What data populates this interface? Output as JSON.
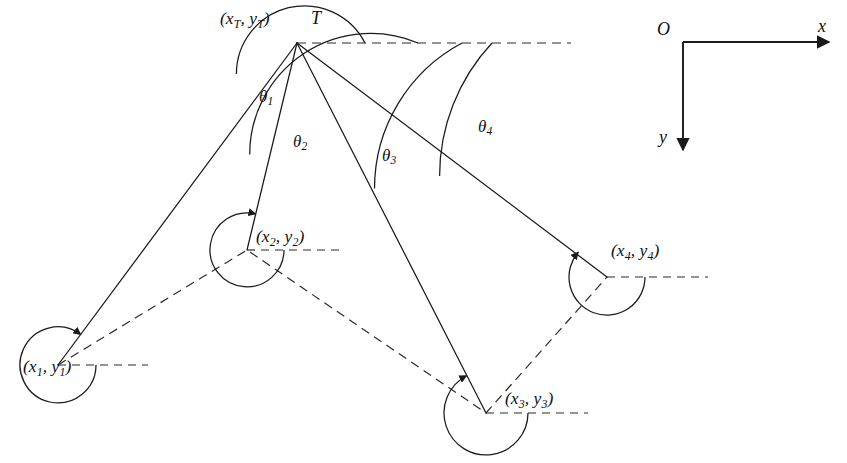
{
  "figure": {
    "type": "geometry-diagram",
    "background_color": "#ffffff",
    "line_color": "#1a1a1a",
    "width": 847,
    "height": 463
  },
  "apex": {
    "name": "T",
    "label": "T",
    "coord_label_open": "(",
    "coord_label_x": "x",
    "coord_label_x_sub": "T",
    "coord_label_comma": ",",
    "coord_label_y": "y",
    "coord_label_y_sub": "T",
    "coord_label_close": ")",
    "x": 297,
    "y": 43
  },
  "reference_line": {
    "name": "horizontal-reference-from-T",
    "style": "dashed",
    "x_start": 297,
    "x_end": 571,
    "y": 43
  },
  "angles": [
    {
      "id": "theta1",
      "symbol": "θ",
      "subscript": "1",
      "arc_radius": 68,
      "label_x": 259,
      "label_y": 88,
      "degrees_from_horizontal": 153
    },
    {
      "id": "theta2",
      "symbol": "θ",
      "subscript": "2",
      "arc_radius": 121,
      "label_x": 293,
      "label_y": 133,
      "degrees_from_horizontal": 113
    },
    {
      "id": "theta3",
      "symbol": "θ",
      "subscript": "3",
      "arc_radius": 165,
      "label_x": 382,
      "label_y": 147,
      "degrees_from_horizontal": 62
    },
    {
      "id": "theta4",
      "symbol": "θ",
      "subscript": "4",
      "arc_radius": 195,
      "label_x": 478,
      "label_y": 118,
      "degrees_from_horizontal": 43
    }
  ],
  "points": [
    {
      "id": "p1",
      "index": "1",
      "open": "(",
      "x_sym": "x",
      "comma": ",",
      "y_sym": "y",
      "close": ")",
      "x": 58,
      "y": 365,
      "label_x": 23,
      "label_y": 358,
      "arc_radius": 38,
      "ref_dash_x_end": 148
    },
    {
      "id": "p2",
      "index": "2",
      "open": "(",
      "x_sym": "x",
      "comma": ",",
      "y_sym": "y",
      "close": ")",
      "x": 247,
      "y": 250,
      "label_x": 256,
      "label_y": 228,
      "arc_radius": 37,
      "ref_dash_x_end": 345
    },
    {
      "id": "p3",
      "index": "3",
      "open": "(",
      "x_sym": "x",
      "comma": ",",
      "y_sym": "y",
      "close": ")",
      "x": 486,
      "y": 413,
      "label_x": 505,
      "label_y": 390,
      "arc_radius": 42,
      "ref_dash_x_end": 588
    },
    {
      "id": "p4",
      "index": "4",
      "open": "(",
      "x_sym": "x",
      "comma": ",",
      "y_sym": "y",
      "close": ")",
      "x": 607,
      "y": 277,
      "label_x": 611,
      "label_y": 242,
      "arc_radius": 38,
      "ref_dash_x_end": 708
    }
  ],
  "trajectory": {
    "name": "dashed-waypoint-path",
    "style": "dashed",
    "vertices": [
      [
        58,
        365
      ],
      [
        247,
        250
      ],
      [
        486,
        413
      ],
      [
        607,
        277
      ]
    ]
  },
  "axes": {
    "origin_label": "O",
    "x_label": "x",
    "y_label": "y",
    "origin_x": 683,
    "origin_y": 42,
    "x_end": 831,
    "y_end": 152,
    "origin_label_x": 657,
    "origin_label_y": 20,
    "x_label_x": 818,
    "x_label_y": 17,
    "y_label_x": 659,
    "y_label_y": 128
  }
}
